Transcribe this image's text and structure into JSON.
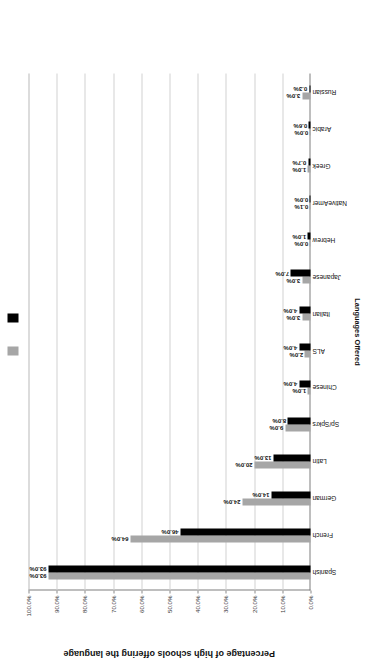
{
  "chart_data": {
    "type": "bar",
    "title": "",
    "xlabel": "Languages Offered",
    "ylabel": "Percentage of high schools offering the language",
    "ylim": [
      0,
      100
    ],
    "grid": true,
    "legend_position": "top",
    "tick_labels": [
      "0.0%",
      "10.0%",
      "20.0%",
      "30.0%",
      "40.0%",
      "50.0%",
      "60.0%",
      "70.0%",
      "80.0%",
      "90.0%",
      "100.0%"
    ],
    "tick_values": [
      0,
      10,
      20,
      30,
      40,
      50,
      60,
      70,
      80,
      90,
      100
    ],
    "categories": [
      "Spanish",
      "French",
      "German",
      "Latin",
      "Sp/Spkrs",
      "Chinese",
      "ALS",
      "Italian",
      "Japanese",
      "Hebrew",
      "NativeAmer",
      "Greek",
      "Arabic",
      "Russian"
    ],
    "series": [
      {
        "name": "Series 1",
        "color": "#a6a6a6",
        "values": [
          93.0,
          64.0,
          24.0,
          20.0,
          9.0,
          1.0,
          2.0,
          3.0,
          3.0,
          0.0,
          0.1,
          1.0,
          0.0,
          3.0
        ],
        "labels": [
          "93.0%",
          "64.0%",
          "24.0%",
          "20.0%",
          "9.0%",
          "1.0%",
          "2.0%",
          "3.0%",
          "3.0%",
          "0.0%",
          "0.1%",
          "1.0%",
          "0.0%",
          "3.0%"
        ]
      },
      {
        "name": "Series 2",
        "color": "#000000",
        "values": [
          93.0,
          46.0,
          14.0,
          13.0,
          8.0,
          4.0,
          4.0,
          4.0,
          7.0,
          1.0,
          0.0,
          0.7,
          0.6,
          0.3
        ],
        "labels": [
          "93.0%",
          "46.0%",
          "14.0%",
          "13.0%",
          "8.0%",
          "4.0%",
          "4.0%",
          "4.0%",
          "7.0%",
          "1.0%",
          "0.0%",
          "0.7%",
          "0.6%",
          "0.3%"
        ]
      }
    ]
  }
}
